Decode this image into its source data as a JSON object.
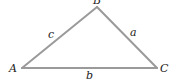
{
  "diagram": {
    "type": "triangle",
    "stroke_color": "#9a9a9a",
    "text_color": "#222222",
    "vertices": [
      {
        "name": "A",
        "x": 22,
        "y": 68
      },
      {
        "name": "B",
        "x": 97,
        "y": 7
      },
      {
        "name": "C",
        "x": 157,
        "y": 68
      }
    ],
    "vertex_labels": {
      "A": "A",
      "B": "B",
      "C": "C"
    },
    "side_labels": {
      "a": "a",
      "b": "b",
      "c": "c"
    }
  }
}
